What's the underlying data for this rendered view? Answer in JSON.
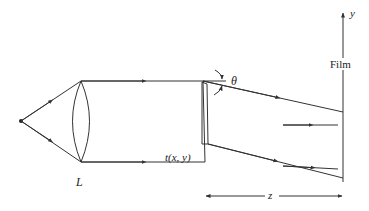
{
  "diagram": {
    "labels": {
      "lens": "L",
      "transparency": "t(x, y)",
      "angle": "θ",
      "film": "Film",
      "axis_y": "y",
      "distance": "z"
    },
    "colors": {
      "line": "#333333",
      "background": "#ffffff"
    }
  }
}
